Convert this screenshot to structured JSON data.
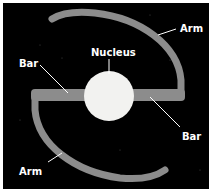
{
  "diagram": {
    "type": "barred spiral galaxy",
    "labels": {
      "arm_top": "Arm",
      "nucleus": "Nucleus",
      "bar_left": "Bar",
      "bar_right": "Bar",
      "arm_bottom": "Arm"
    },
    "colors": {
      "background": "#000000",
      "structure": "#8c8c8c",
      "nucleus": "#f2f2f0",
      "text": "#ffffff",
      "border": "#ffffff"
    }
  }
}
